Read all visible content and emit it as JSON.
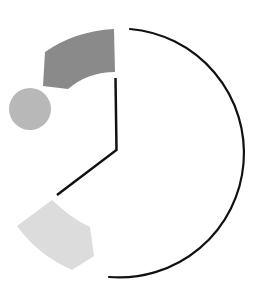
{
  "diagram": {
    "colors": {
      "background": "#ffffff",
      "stroke": "#111111",
      "dark_wedge": "#8a8a8a",
      "circle": "#b8b8b8",
      "light_wedge": "#dcdcdc"
    },
    "shapes": [
      {
        "name": "outer-arc",
        "type": "arc"
      },
      {
        "name": "clock-hands",
        "type": "polyline"
      },
      {
        "name": "dark-wedge",
        "type": "annular-sector"
      },
      {
        "name": "gray-circle",
        "type": "circle"
      },
      {
        "name": "light-wedge",
        "type": "annular-sector"
      }
    ]
  }
}
